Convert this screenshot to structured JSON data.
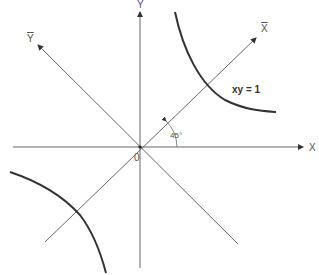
{
  "diagram": {
    "labels": {
      "x_axis": "X",
      "y_axis": "Y",
      "x_bar_axis": "X",
      "y_bar_axis": "Y",
      "origin": "0",
      "angle": "45°",
      "curve": "xy = 1"
    },
    "colors": {
      "axis": "#555555",
      "curve": "#333333",
      "text": "#555555"
    }
  }
}
